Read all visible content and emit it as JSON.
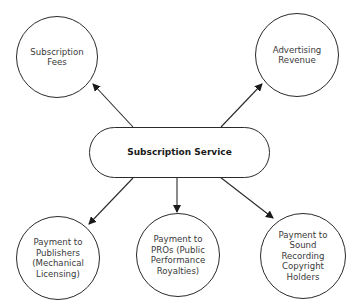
{
  "diagram": {
    "center": {
      "label": "Subscription Service"
    },
    "sources": [
      {
        "id": "subscription-fees",
        "label": "Subscription\nFees"
      },
      {
        "id": "advertising-revenue",
        "label": "Advertising\nRevenue"
      }
    ],
    "payments": [
      {
        "id": "publishers",
        "label": "Payment to\nPublishers\n(Mechanical\nLicensing)"
      },
      {
        "id": "pros",
        "label": "Payment to\nPROs (Public\nPerformance\nRoyalties)"
      },
      {
        "id": "sound-recording",
        "label": "Payment to\nSound\nRecording\nCopyright\nHolders"
      }
    ],
    "edges": [
      {
        "from": "Subscription Service",
        "to": "Subscription Fees"
      },
      {
        "from": "Subscription Service",
        "to": "Advertising Revenue"
      },
      {
        "from": "Subscription Service",
        "to": "Payment to Publishers (Mechanical Licensing)"
      },
      {
        "from": "Subscription Service",
        "to": "Payment to PROs (Public Performance Royalties)"
      },
      {
        "from": "Subscription Service",
        "to": "Payment to Sound Recording Copyright Holders"
      }
    ],
    "colors": {
      "stroke": "#2a2a2a",
      "text": "#3a3a3a",
      "background": "#ffffff"
    }
  }
}
